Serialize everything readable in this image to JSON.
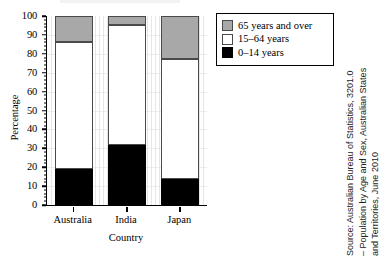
{
  "chart_data": {
    "type": "bar",
    "subtype": "stacked-100-percent",
    "title": "",
    "xlabel": "Country",
    "ylabel": "Percentage",
    "categories": [
      "Australia",
      "India",
      "Japan"
    ],
    "ylim": [
      0,
      100
    ],
    "ytick_step": 10,
    "yticks": [
      "0",
      "10",
      "20",
      "30",
      "40",
      "50",
      "60",
      "70",
      "80",
      "90",
      "100"
    ],
    "grid": true,
    "legend_position": "top-right",
    "series": [
      {
        "name": "0–14 years",
        "color": "#000000",
        "values": [
          19,
          31.5,
          13.5
        ]
      },
      {
        "name": "15–64 years",
        "color": "#ffffff",
        "values": [
          67,
          63.5,
          63.5
        ]
      },
      {
        "name": "65 years and over",
        "color": "#a8a8a8",
        "values": [
          14,
          5,
          23
        ]
      }
    ],
    "stack_boundaries": {
      "Australia": [
        19,
        86,
        100
      ],
      "India": [
        31.5,
        95,
        100
      ],
      "Japan": [
        13.5,
        77,
        100
      ]
    }
  },
  "legend": {
    "items": [
      {
        "label": "65 years and over",
        "swatch": "gray-swatch"
      },
      {
        "label": "15–64 years",
        "swatch": "white-swatch"
      },
      {
        "label": "0–14 years",
        "swatch": "black-swatch"
      }
    ]
  },
  "source": {
    "lines": [
      "Source: Australian Bureau of Statistics, 3201.0",
      "– Population by Age and Sex, Australian States",
      "and Territories, June 2010"
    ]
  }
}
